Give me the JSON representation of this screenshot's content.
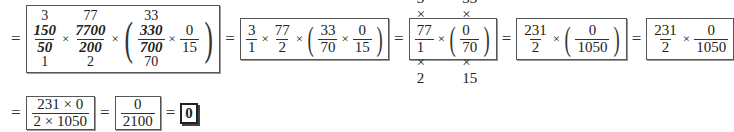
{
  "row1": {
    "lead_eq": "=",
    "box1": {
      "f1": {
        "above": "3",
        "num": "150",
        "den": "50",
        "below": "1"
      },
      "f2": {
        "above": "77",
        "num": "7700",
        "den": "200",
        "below": "2"
      },
      "f3": {
        "above": "33",
        "num": "330",
        "den": "700",
        "below": "70"
      },
      "f4": {
        "num": "0",
        "den": "15"
      },
      "times": "×"
    },
    "eq2": "=",
    "box2": {
      "f1": {
        "num": "3",
        "den": "1"
      },
      "f2": {
        "num": "77",
        "den": "2"
      },
      "f3": {
        "num": "33",
        "den": "70"
      },
      "f4": {
        "num": "0",
        "den": "15"
      }
    },
    "eq3": "=",
    "box3": {
      "f1": {
        "num": "3 × 77",
        "den": "1 × 2"
      },
      "f2": {
        "num": "33 × 0",
        "den": "70 × 15"
      }
    },
    "eq4": "=",
    "box4": {
      "f1": {
        "num": "231",
        "den": "2"
      },
      "f2": {
        "num": "0",
        "den": "1050"
      }
    },
    "eq5": "=",
    "box5": {
      "f1": {
        "num": "231",
        "den": "2"
      },
      "f2": {
        "num": "0",
        "den": "1050"
      }
    }
  },
  "row2": {
    "lead_eq": "=",
    "box6": {
      "num": "231 × 0",
      "den": "2 × 1050"
    },
    "eq2": "=",
    "box7": {
      "num": "0",
      "den": "2100"
    },
    "eq3": "=",
    "final": "0"
  },
  "symbols": {
    "times": "×",
    "lparen": "(",
    "rparen": ")"
  }
}
